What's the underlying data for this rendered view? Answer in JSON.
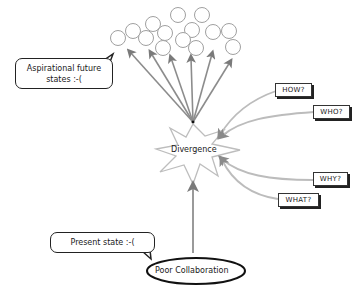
{
  "diagram": {
    "future_bubble": {
      "line1": "Aspirational future",
      "line2": "states :-("
    },
    "center_node": {
      "label": "Divergence",
      "shape": "star"
    },
    "present_bubble": {
      "label": "Present state :-("
    },
    "root_node": {
      "label": "Poor Collaboration",
      "shape": "ellipse"
    },
    "questions": [
      {
        "label": "HOW?"
      },
      {
        "label": "WHO?"
      },
      {
        "label": "WHY?"
      },
      {
        "label": "WHAT?"
      }
    ],
    "future_states_count": 15,
    "colors": {
      "arrow": "#8c8c8c",
      "question_arrow": "#b8b8b8",
      "outline": "#222222",
      "circle": "#9a9a9a"
    }
  }
}
